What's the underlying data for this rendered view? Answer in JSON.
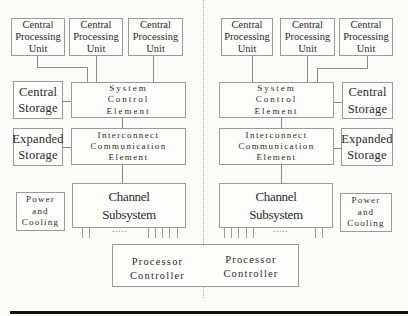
{
  "diagram": {
    "type": "system-architecture",
    "sides": {
      "left": {
        "cpus": [
          {
            "line1": "Central",
            "line2": "Processing",
            "line3": "Unit"
          },
          {
            "line1": "Central",
            "line2": "Processing",
            "line3": "Unit"
          },
          {
            "line1": "Central",
            "line2": "Processing",
            "line3": "Unit"
          }
        ],
        "central_storage": {
          "line1": "Central",
          "line2": "Storage"
        },
        "system_control": {
          "line1": "System",
          "line2": "Control",
          "line3": "Element"
        },
        "expanded_storage": {
          "line1": "Expanded",
          "line2": "Storage"
        },
        "interconnect": {
          "line1": "Interconnect",
          "line2": "Communication",
          "line3": "Element"
        },
        "channel": {
          "line1": "Channel",
          "line2": "Subsystem"
        },
        "power": {
          "line1": "Power",
          "line2": "and",
          "line3": "Cooling"
        },
        "channel_dots": "....."
      },
      "right": {
        "cpus": [
          {
            "line1": "Central",
            "line2": "Processing",
            "line3": "Unit"
          },
          {
            "line1": "Central",
            "line2": "Processing",
            "line3": "Unit"
          },
          {
            "line1": "Central",
            "line2": "Processing",
            "line3": "Unit"
          }
        ],
        "central_storage": {
          "line1": "Central",
          "line2": "Storage"
        },
        "system_control": {
          "line1": "System",
          "line2": "Control",
          "line3": "Element"
        },
        "expanded_storage": {
          "line1": "Expanded",
          "line2": "Storage"
        },
        "interconnect": {
          "line1": "Interconnect",
          "line2": "Communication",
          "line3": "Element"
        },
        "channel": {
          "line1": "Channel",
          "line2": "Subsystem"
        },
        "power": {
          "line1": "Power",
          "line2": "and",
          "line3": "Cooling"
        },
        "channel_dots": "....."
      }
    },
    "processor_controller": {
      "left": {
        "line1": "Processor",
        "line2": "Controller"
      },
      "right": {
        "line1": "Processor",
        "line2": "Controller"
      }
    },
    "colors": {
      "border": "#9a9a9a",
      "connector": "#8a8a8a",
      "rule": "#111111",
      "background": "#fbfbf9"
    }
  }
}
